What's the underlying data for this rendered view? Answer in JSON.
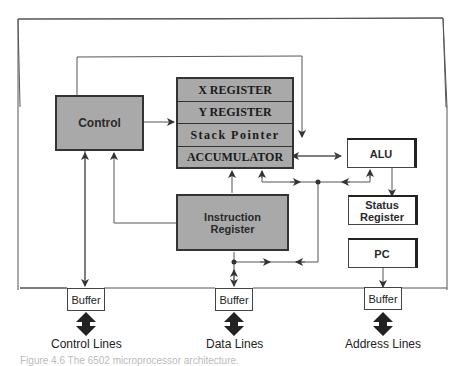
{
  "diagram": {
    "type": "block-diagram",
    "blocks": {
      "control": "Control",
      "registers": [
        "X REGISTER",
        "Y REGISTER",
        "Stack Pointer",
        "ACCUMULATOR"
      ],
      "instruction_register": "Instruction Register",
      "alu": "ALU",
      "status_register": "Status Register",
      "pc": "PC"
    },
    "buffers": [
      {
        "label": "Buffer",
        "lines": "Control Lines"
      },
      {
        "label": "Buffer",
        "lines": "Data Lines"
      },
      {
        "label": "Buffer",
        "lines": "Address Lines"
      }
    ],
    "caption": "Figure 4.6   The 6502 microprocessor architecture."
  },
  "colors": {
    "block_gray": "#a9a9a9",
    "line": "#444444",
    "text": "#222222"
  }
}
